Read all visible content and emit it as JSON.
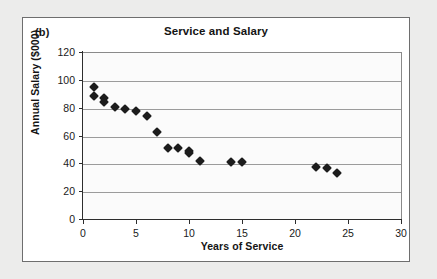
{
  "figure": {
    "panel_label": "(b)"
  },
  "chart_data": {
    "type": "scatter",
    "title": "Service and Salary",
    "xlabel": "Years of Service",
    "ylabel": "Annual Salary ($000)",
    "xlim": [
      0,
      30
    ],
    "ylim": [
      0,
      120
    ],
    "xticks": [
      0,
      5,
      10,
      15,
      20,
      25,
      30
    ],
    "yticks": [
      0,
      20,
      40,
      60,
      80,
      100,
      120
    ],
    "grid": "horizontal",
    "legend": "none",
    "marker": "filled-diamond",
    "marker_color": "#1c1c1c",
    "series": [
      {
        "name": "Employees",
        "points": [
          [
            1,
            95.5
          ],
          [
            1,
            89.0
          ],
          [
            2,
            88.0
          ],
          [
            2,
            84.5
          ],
          [
            3,
            81.0
          ],
          [
            4,
            79.5
          ],
          [
            5,
            78.5
          ],
          [
            6,
            75.0
          ],
          [
            7,
            63.0
          ],
          [
            8,
            51.5
          ],
          [
            9,
            51.5
          ],
          [
            10,
            49.5
          ],
          [
            10,
            48.5
          ],
          [
            11,
            42.5
          ],
          [
            14,
            41.5
          ],
          [
            15,
            41.5
          ],
          [
            22,
            38.0
          ],
          [
            23,
            37.5
          ],
          [
            24,
            34.0
          ]
        ]
      }
    ]
  }
}
